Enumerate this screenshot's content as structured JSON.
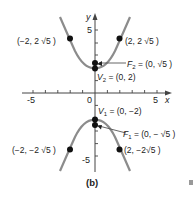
{
  "figure": {
    "caption": "(b)",
    "axes": {
      "x_label": "x",
      "y_label": "y",
      "x_ticks": [
        "-5",
        "0",
        "5"
      ],
      "y_ticks": [
        "5",
        "-5"
      ],
      "x_range": [
        -5,
        5
      ],
      "y_range": [
        -5,
        5
      ]
    },
    "curve": {
      "equation": "y^2/4 - x^2 = 1",
      "color": "#8c8c8c"
    },
    "points": [
      {
        "id": "V2",
        "label_main": "V",
        "label_sub": "2",
        "label_rest": " = (0, 2)",
        "x": 0,
        "y": 2
      },
      {
        "id": "F2",
        "label_main": "F",
        "label_sub": "2",
        "label_rest": " = (0, √5 )",
        "x": 0,
        "y": 2.236
      },
      {
        "id": "V1",
        "label_main": "V",
        "label_sub": "1",
        "label_rest": " = (0, −2)",
        "x": 0,
        "y": -2
      },
      {
        "id": "F1",
        "label_main": "F",
        "label_sub": "1",
        "label_rest": " = (0, − √5 )",
        "x": 0,
        "y": -2.236
      },
      {
        "id": "P1",
        "label": "(−2, 2 √5 )",
        "x": -2,
        "y": 4.472
      },
      {
        "id": "P2",
        "label": "(2, 2 √5 )",
        "x": 2,
        "y": 4.472
      },
      {
        "id": "P3",
        "label": "(−2, −2 √5 )",
        "x": -2,
        "y": -4.472
      },
      {
        "id": "P4",
        "label": "(2, −2√5 )",
        "x": 2,
        "y": -4.472
      }
    ]
  }
}
